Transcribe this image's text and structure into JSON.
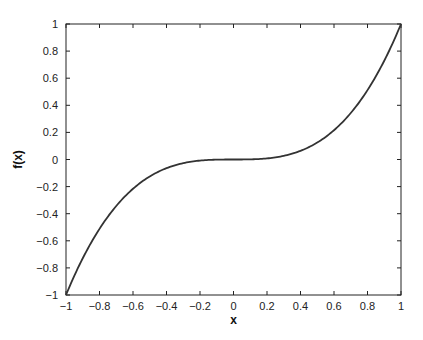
{
  "chart_data": {
    "type": "line",
    "title": "",
    "xlabel": "x",
    "ylabel": "f(x)",
    "xlim": [
      -1,
      1
    ],
    "ylim": [
      -1,
      1
    ],
    "grid": false,
    "legend": null,
    "x_ticks": [
      -1,
      -0.8,
      -0.6,
      -0.4,
      -0.2,
      0,
      0.2,
      0.4,
      0.6,
      0.8,
      1
    ],
    "x_tick_labels": [
      "−1",
      "−0.8",
      "−0.6",
      "−0.4",
      "−0.2",
      "0",
      "0.2",
      "0.4",
      "0.6",
      "0.8",
      "1"
    ],
    "y_ticks": [
      -1,
      -0.8,
      -0.6,
      -0.4,
      -0.2,
      0,
      0.2,
      0.4,
      0.6,
      0.8,
      1
    ],
    "y_tick_labels": [
      "−1",
      "−0.8",
      "−0.6",
      "−0.4",
      "−0.2",
      "0",
      "0.2",
      "0.4",
      "0.6",
      "0.8",
      "1"
    ],
    "series": [
      {
        "name": "f(x) = x^3",
        "color": "#333333",
        "x": [
          -1,
          -0.9,
          -0.8,
          -0.7,
          -0.6,
          -0.5,
          -0.4,
          -0.3,
          -0.2,
          -0.1,
          0,
          0.1,
          0.2,
          0.3,
          0.4,
          0.5,
          0.6,
          0.7,
          0.8,
          0.9,
          1
        ],
        "y": [
          -1,
          -0.729,
          -0.512,
          -0.343,
          -0.216,
          -0.125,
          -0.064,
          -0.027,
          -0.008,
          -0.001,
          0,
          0.001,
          0.008,
          0.027,
          0.064,
          0.125,
          0.216,
          0.343,
          0.512,
          0.729,
          1
        ]
      }
    ]
  }
}
